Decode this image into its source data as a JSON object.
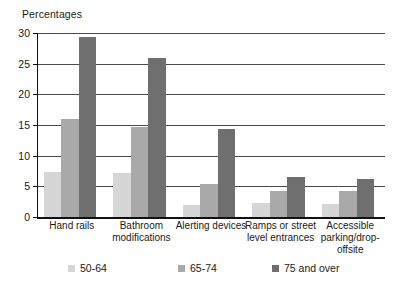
{
  "chart_data": {
    "type": "bar",
    "title": "",
    "ylabel": "Percentages",
    "xlabel": "",
    "ylim": [
      0,
      30
    ],
    "yticks": [
      0,
      5,
      10,
      15,
      20,
      25,
      30
    ],
    "grid": true,
    "legend_position": "bottom",
    "categories": [
      "Hand rails",
      "Bathroom\nmodifications",
      "Alerting devices",
      "Ramps or street\nlevel entrances",
      "Accessible\nparking/drop-\noffsite"
    ],
    "series": [
      {
        "name": "50-64",
        "color": "#d6d6d6",
        "values": [
          7.3,
          7.1,
          2.0,
          2.3,
          2.2
        ]
      },
      {
        "name": "65-74",
        "color": "#a9a9a9",
        "values": [
          15.9,
          14.7,
          5.4,
          4.2,
          4.3
        ]
      },
      {
        "name": "75 and over",
        "color": "#6f6f6f",
        "values": [
          29.4,
          26.0,
          14.3,
          6.5,
          6.2
        ]
      }
    ]
  }
}
